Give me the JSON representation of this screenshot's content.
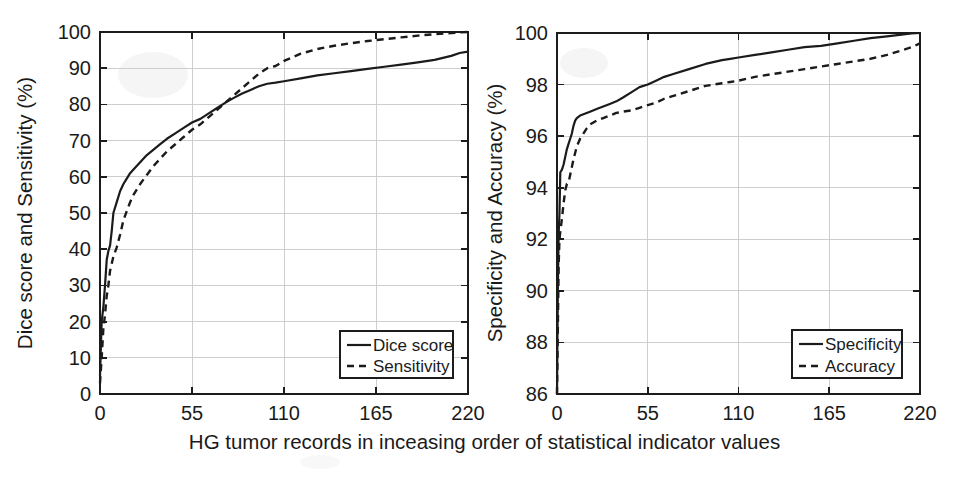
{
  "figure": {
    "xlabel": "HG tumor records in inceasing order of statistical indicator values",
    "background_color": "#ffffff",
    "line_color": "#1b1b1b",
    "grid_color": "#c9c9c9"
  },
  "chart_data": [
    {
      "type": "line",
      "panel": "left",
      "title": "",
      "xlabel": "HG tumor records in inceasing order of statistical indicator values",
      "ylabel": "Dice score and Sensitivity (%)",
      "xlim": [
        0,
        220
      ],
      "ylim": [
        0,
        100
      ],
      "xticks": [
        0,
        55,
        110,
        165,
        220
      ],
      "yticks": [
        0,
        10,
        20,
        30,
        40,
        50,
        60,
        70,
        80,
        90,
        100
      ],
      "grid": true,
      "legend_position": "lower right",
      "series": [
        {
          "name": "Dice score",
          "style": "solid",
          "x": [
            0,
            1,
            2,
            3,
            4,
            5,
            6,
            7,
            8,
            10,
            12,
            14,
            16,
            18,
            20,
            24,
            28,
            32,
            36,
            40,
            45,
            50,
            55,
            60,
            65,
            70,
            75,
            80,
            85,
            90,
            95,
            100,
            105,
            110,
            120,
            130,
            140,
            150,
            160,
            170,
            180,
            190,
            200,
            210,
            215,
            220
          ],
          "y": [
            5,
            20,
            24,
            30,
            37,
            39.5,
            41,
            45,
            50,
            53,
            56,
            58,
            59.5,
            61,
            62,
            64,
            66,
            67.5,
            69,
            70.5,
            72,
            73.5,
            75,
            76,
            77.5,
            79,
            80.5,
            81.8,
            83,
            84,
            85,
            85.7,
            86,
            86.4,
            87.2,
            88,
            88.6,
            89.2,
            89.8,
            90.4,
            91,
            91.6,
            92.3,
            93.4,
            94.2,
            94.6
          ]
        },
        {
          "name": "Sensitivity",
          "style": "dashed",
          "x": [
            0,
            1,
            2,
            3,
            4,
            5,
            6,
            7,
            8,
            10,
            12,
            14,
            16,
            18,
            20,
            24,
            28,
            32,
            36,
            40,
            45,
            50,
            55,
            60,
            65,
            70,
            75,
            80,
            85,
            90,
            95,
            100,
            105,
            110,
            120,
            130,
            140,
            150,
            160,
            170,
            180,
            190,
            200,
            210,
            215,
            220
          ],
          "y": [
            3,
            10,
            18,
            22,
            27,
            30,
            34,
            36,
            38,
            40.5,
            44,
            48,
            50.5,
            53,
            55,
            58,
            60.5,
            63,
            65,
            67,
            69,
            71,
            73,
            74.5,
            76.5,
            78.5,
            80.5,
            82.5,
            84.5,
            86.5,
            88.5,
            90,
            90.6,
            92,
            94,
            95.3,
            96.2,
            96.9,
            97.5,
            98,
            98.5,
            99,
            99.4,
            99.7,
            99.9,
            100
          ]
        }
      ]
    },
    {
      "type": "line",
      "panel": "right",
      "title": "",
      "xlabel": "HG tumor records in inceasing order of statistical indicator values",
      "ylabel": "Specificity and Accuracy (%)",
      "xlim": [
        0,
        220
      ],
      "ylim": [
        86,
        100
      ],
      "xticks": [
        0,
        55,
        110,
        165,
        220
      ],
      "yticks": [
        86,
        88,
        90,
        92,
        94,
        96,
        98,
        100
      ],
      "grid": true,
      "legend_position": "lower right",
      "series": [
        {
          "name": "Specificity",
          "style": "solid",
          "x": [
            0,
            0.5,
            1,
            1.5,
            2,
            3,
            4,
            5,
            6,
            7,
            8,
            9,
            10,
            11,
            12,
            13,
            14,
            16,
            18,
            20,
            24,
            28,
            32,
            36,
            40,
            45,
            50,
            55,
            60,
            65,
            70,
            80,
            90,
            100,
            105,
            110,
            120,
            130,
            140,
            150,
            160,
            170,
            180,
            190,
            200,
            210,
            215,
            220
          ],
          "y": [
            86.0,
            90.0,
            92.2,
            93.0,
            94.6,
            94.7,
            94.9,
            95.2,
            95.5,
            95.7,
            95.9,
            96.1,
            96.4,
            96.6,
            96.7,
            96.75,
            96.8,
            96.85,
            96.9,
            96.95,
            97.05,
            97.15,
            97.25,
            97.35,
            97.5,
            97.7,
            97.9,
            98.0,
            98.15,
            98.3,
            98.4,
            98.6,
            98.8,
            98.95,
            99.0,
            99.05,
            99.15,
            99.25,
            99.35,
            99.45,
            99.5,
            99.6,
            99.7,
            99.8,
            99.87,
            99.95,
            99.98,
            100.0
          ]
        },
        {
          "name": "Accuracy",
          "style": "dashed",
          "x": [
            0,
            0.5,
            1,
            1.5,
            2,
            3,
            4,
            5,
            6,
            7,
            8,
            9,
            10,
            12,
            14,
            16,
            18,
            20,
            24,
            28,
            32,
            36,
            40,
            45,
            50,
            55,
            60,
            65,
            70,
            80,
            90,
            100,
            105,
            110,
            120,
            130,
            140,
            150,
            160,
            170,
            180,
            190,
            200,
            210,
            215,
            220
          ],
          "y": [
            86.0,
            88.5,
            91.0,
            92.0,
            92.3,
            92.8,
            93.4,
            93.9,
            94.15,
            94.2,
            94.5,
            94.8,
            95.1,
            95.6,
            95.9,
            96.1,
            96.3,
            96.45,
            96.6,
            96.7,
            96.8,
            96.9,
            96.95,
            97.0,
            97.1,
            97.2,
            97.3,
            97.45,
            97.55,
            97.75,
            97.95,
            98.05,
            98.1,
            98.15,
            98.3,
            98.4,
            98.5,
            98.6,
            98.7,
            98.8,
            98.9,
            99.0,
            99.15,
            99.35,
            99.45,
            99.6
          ]
        }
      ]
    }
  ],
  "left_panel": {
    "ylabel": "Dice score and Sensitivity (%)",
    "ytick_labels": [
      "100",
      "90",
      "80",
      "70",
      "60",
      "50",
      "40",
      "30",
      "20",
      "10",
      "0"
    ],
    "xtick_labels": [
      "0",
      "55",
      "110",
      "165",
      "220"
    ],
    "legend": {
      "items": [
        {
          "label": "Dice score",
          "style": "solid"
        },
        {
          "label": "Sensitivity",
          "style": "dashed"
        }
      ]
    }
  },
  "right_panel": {
    "ylabel": "Specificity and Accuracy (%)",
    "ytick_labels": [
      "100",
      "98",
      "96",
      "94",
      "92",
      "90",
      "88",
      "86"
    ],
    "xtick_labels": [
      "0",
      "55",
      "110",
      "165",
      "220"
    ],
    "legend": {
      "items": [
        {
          "label": "Specificity",
          "style": "solid"
        },
        {
          "label": "Accuracy",
          "style": "dashed"
        }
      ]
    }
  }
}
